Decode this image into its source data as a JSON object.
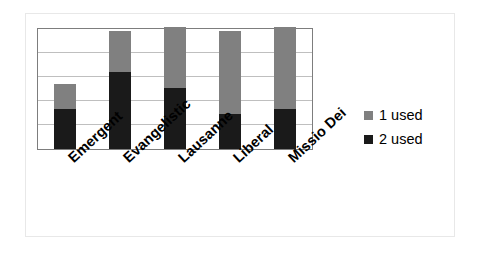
{
  "chart_data": {
    "type": "bar",
    "subtype": "stacked-vertical",
    "title": "",
    "xlabel": "",
    "ylabel": "",
    "categories": [
      "Emergent",
      "Evangelistic",
      "Lausanne",
      "Liberal",
      "Missio Dei"
    ],
    "series": [
      {
        "name": "2 used",
        "color": "#1a1a1a",
        "values": [
          33,
          63,
          50,
          29,
          33
        ]
      },
      {
        "name": "1 used",
        "color": "#808080",
        "values": [
          20,
          34,
          50,
          68,
          67
        ]
      }
    ],
    "totals": [
      53,
      97,
      100,
      97,
      100
    ],
    "ylim": [
      0,
      100
    ],
    "y_tick_interval": 20,
    "y_tick_labels": [],
    "grid": true,
    "grid_axis": "y",
    "legend_position": "right",
    "stack_order_bottom_to_top": [
      "2 used",
      "1 used"
    ]
  },
  "legend": {
    "items": [
      {
        "label": "1 used",
        "swatch": "gray-swatch-icon",
        "color": "#808080"
      },
      {
        "label": "2 used",
        "swatch": "black-swatch-icon",
        "color": "#1a1a1a"
      }
    ]
  },
  "colors": {
    "series_1_used": "#808080",
    "series_2_used": "#1a1a1a",
    "plot_border": "#7d7d7d",
    "gridline": "#bfbfbf",
    "outer_frame": "#e8e8e8",
    "background": "#ffffff",
    "text": "#000000"
  }
}
